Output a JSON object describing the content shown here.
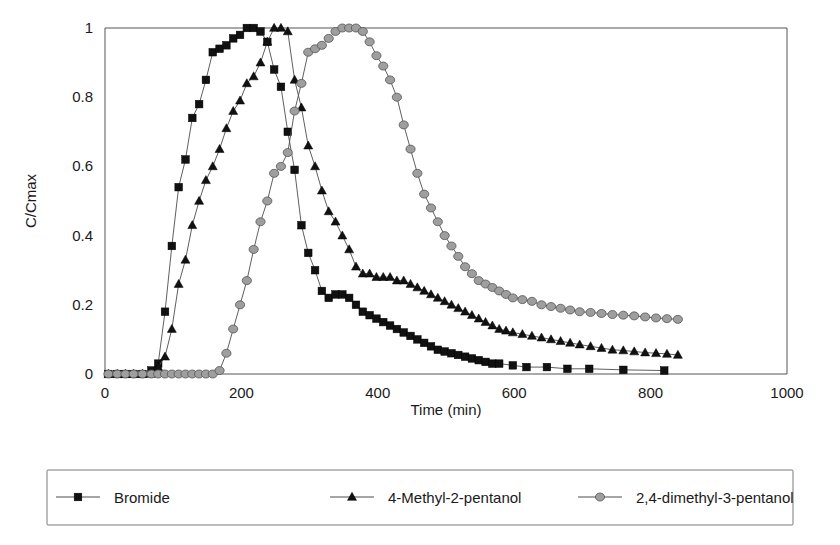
{
  "chart_data": {
    "type": "line",
    "title": "",
    "xlabel": "Time (min)",
    "ylabel": "C/Cmax",
    "xlim": [
      0,
      1000
    ],
    "ylim": [
      0,
      1
    ],
    "xticks": [
      0,
      200,
      400,
      600,
      800,
      1000
    ],
    "yticks": [
      0,
      0.2,
      0.4,
      0.6,
      0.8,
      1
    ],
    "xtick_labels": [
      "0",
      "200",
      "400",
      "600",
      "800",
      "1000"
    ],
    "ytick_labels": [
      "0",
      "0.2",
      "0.4",
      "0.6",
      "0.8",
      "1"
    ],
    "grid": false,
    "legend_position": "below-plot",
    "markers": {
      "Bromide": "square",
      "4-Methyl-2-pentanol": "triangle",
      "2,4-dimethyl-3-pentanol": "circle"
    },
    "colors": {
      "Bromide": "#111111",
      "4-Methyl-2-pentanol": "#111111",
      "2,4-dimethyl-3-pentanol": "#9e9e9e",
      "line": "#4d4d4d",
      "axis": "#555555",
      "text": "#1a1a1a",
      "background": "#ffffff"
    },
    "series": [
      {
        "name": "Bromide",
        "marker": "square",
        "color": "#111111",
        "x": [
          5,
          18,
          30,
          42,
          55,
          68,
          78,
          88,
          98,
          108,
          118,
          128,
          138,
          148,
          158,
          168,
          178,
          188,
          198,
          208,
          218,
          228,
          238,
          248,
          258,
          268,
          278,
          288,
          298,
          308,
          318,
          328,
          338,
          348,
          358,
          368,
          378,
          388,
          398,
          408,
          418,
          428,
          438,
          448,
          458,
          468,
          478,
          488,
          498,
          508,
          518,
          528,
          538,
          548,
          558,
          568,
          578,
          598,
          618,
          648,
          678,
          710,
          760,
          820
        ],
        "y": [
          0.0,
          0.0,
          0.0,
          0.0,
          0.0,
          0.01,
          0.03,
          0.18,
          0.37,
          0.54,
          0.62,
          0.74,
          0.78,
          0.85,
          0.93,
          0.94,
          0.95,
          0.97,
          0.98,
          1.0,
          1.0,
          0.99,
          0.96,
          0.88,
          0.83,
          0.7,
          0.59,
          0.43,
          0.35,
          0.3,
          0.24,
          0.22,
          0.23,
          0.23,
          0.22,
          0.2,
          0.18,
          0.17,
          0.16,
          0.15,
          0.14,
          0.13,
          0.12,
          0.11,
          0.1,
          0.09,
          0.08,
          0.07,
          0.065,
          0.06,
          0.055,
          0.05,
          0.045,
          0.04,
          0.035,
          0.03,
          0.03,
          0.025,
          0.02,
          0.02,
          0.015,
          0.015,
          0.012,
          0.01
        ]
      },
      {
        "name": "4-Methyl-2-pentanol",
        "marker": "triangle",
        "color": "#111111",
        "x": [
          5,
          18,
          30,
          42,
          55,
          68,
          78,
          88,
          98,
          108,
          118,
          128,
          138,
          148,
          158,
          168,
          178,
          188,
          198,
          208,
          218,
          228,
          238,
          248,
          258,
          268,
          278,
          288,
          298,
          308,
          318,
          328,
          338,
          348,
          358,
          368,
          378,
          388,
          398,
          408,
          418,
          428,
          438,
          448,
          458,
          468,
          478,
          488,
          498,
          508,
          518,
          528,
          538,
          548,
          558,
          568,
          578,
          588,
          598,
          612,
          626,
          640,
          654,
          668,
          682,
          696,
          712,
          728,
          744,
          760,
          776,
          792,
          808,
          824,
          840
        ],
        "y": [
          0.0,
          0.0,
          0.0,
          0.0,
          0.0,
          0.0,
          0.02,
          0.05,
          0.13,
          0.26,
          0.33,
          0.43,
          0.5,
          0.56,
          0.6,
          0.65,
          0.71,
          0.76,
          0.79,
          0.84,
          0.86,
          0.9,
          0.96,
          1.0,
          1.0,
          0.99,
          0.85,
          0.77,
          0.66,
          0.6,
          0.53,
          0.47,
          0.44,
          0.4,
          0.36,
          0.31,
          0.29,
          0.29,
          0.28,
          0.28,
          0.28,
          0.27,
          0.27,
          0.26,
          0.25,
          0.24,
          0.23,
          0.22,
          0.21,
          0.2,
          0.19,
          0.18,
          0.17,
          0.16,
          0.15,
          0.14,
          0.13,
          0.125,
          0.12,
          0.115,
          0.11,
          0.105,
          0.1,
          0.095,
          0.09,
          0.085,
          0.08,
          0.075,
          0.07,
          0.068,
          0.065,
          0.062,
          0.06,
          0.058,
          0.055
        ]
      },
      {
        "name": "2,4-dimethyl-3-pentanol",
        "marker": "circle",
        "color": "#9e9e9e",
        "x": [
          5,
          18,
          30,
          42,
          55,
          68,
          78,
          88,
          98,
          108,
          118,
          128,
          138,
          148,
          158,
          168,
          178,
          188,
          198,
          208,
          218,
          228,
          238,
          248,
          258,
          268,
          278,
          288,
          298,
          308,
          318,
          328,
          338,
          348,
          358,
          368,
          378,
          388,
          398,
          408,
          418,
          428,
          438,
          448,
          458,
          468,
          478,
          488,
          498,
          508,
          518,
          528,
          538,
          548,
          558,
          568,
          578,
          588,
          598,
          612,
          626,
          640,
          654,
          668,
          682,
          696,
          712,
          728,
          744,
          760,
          776,
          792,
          808,
          824,
          840
        ],
        "y": [
          0.0,
          0.0,
          0.0,
          0.0,
          0.0,
          0.0,
          0.0,
          0.0,
          0.0,
          0.0,
          0.0,
          0.0,
          0.0,
          0.0,
          0.0,
          0.01,
          0.06,
          0.13,
          0.2,
          0.27,
          0.36,
          0.44,
          0.5,
          0.58,
          0.6,
          0.64,
          0.76,
          0.84,
          0.93,
          0.94,
          0.95,
          0.97,
          0.99,
          1.0,
          1.0,
          1.0,
          0.99,
          0.96,
          0.92,
          0.89,
          0.85,
          0.8,
          0.72,
          0.65,
          0.58,
          0.52,
          0.48,
          0.44,
          0.4,
          0.37,
          0.34,
          0.31,
          0.29,
          0.27,
          0.26,
          0.25,
          0.24,
          0.23,
          0.22,
          0.215,
          0.21,
          0.2,
          0.195,
          0.19,
          0.185,
          0.18,
          0.178,
          0.175,
          0.172,
          0.17,
          0.168,
          0.165,
          0.162,
          0.16,
          0.158
        ]
      }
    ],
    "legend": [
      {
        "label": "Bromide",
        "marker": "square",
        "color": "#111111"
      },
      {
        "label": "4-Methyl-2-pentanol",
        "marker": "triangle",
        "color": "#111111"
      },
      {
        "label": "2,4-dimethyl-3-pentanol",
        "marker": "circle",
        "color": "#9e9e9e"
      }
    ]
  }
}
